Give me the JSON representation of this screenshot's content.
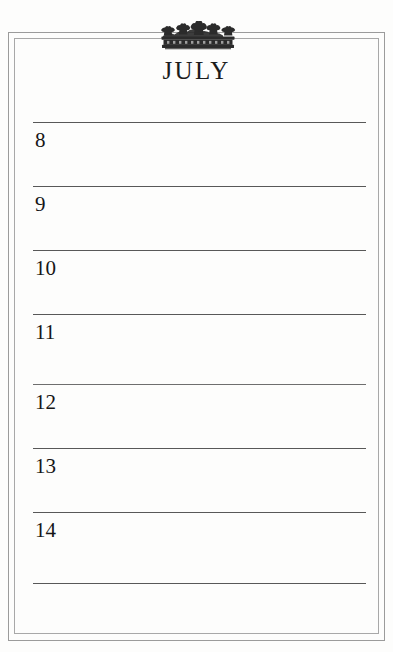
{
  "page": {
    "kind": "planner-page",
    "background_color": "#fdfdfc",
    "border_color": "#9b9b9b",
    "rule_color": "#585858",
    "ink_color": "#161616"
  },
  "ornament": {
    "name": "crown-ornament",
    "icon": "crown-icon",
    "color": "#2b2b2b"
  },
  "header": {
    "month": "JULY"
  },
  "entries": [
    {
      "day": "8",
      "line_y": 122,
      "num_y": 128
    },
    {
      "day": "9",
      "line_y": 186,
      "num_y": 192
    },
    {
      "day": "10",
      "line_y": 250,
      "num_y": 256
    },
    {
      "day": "11",
      "line_y": 314,
      "num_y": 320
    },
    {
      "day": "12",
      "line_y": 384,
      "num_y": 390
    },
    {
      "day": "13",
      "line_y": 448,
      "num_y": 454
    },
    {
      "day": "14",
      "line_y": 512,
      "num_y": 518
    }
  ],
  "closing_rule": {
    "line_y": 583
  }
}
